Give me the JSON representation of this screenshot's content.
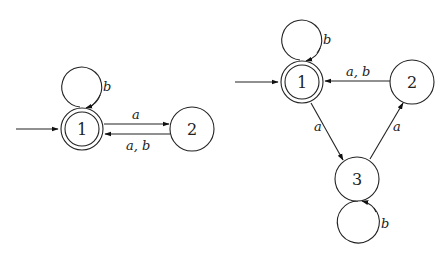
{
  "diagram": {
    "type": "finite-automata",
    "automata": [
      {
        "name": "left",
        "states": [
          {
            "id": "1",
            "label": "1",
            "initial": true,
            "accepting": true
          },
          {
            "id": "2",
            "label": "2",
            "initial": false,
            "accepting": false
          }
        ],
        "transitions": [
          {
            "from": "1",
            "to": "1",
            "label": "b"
          },
          {
            "from": "1",
            "to": "2",
            "label": "a"
          },
          {
            "from": "2",
            "to": "1",
            "label": "a, b"
          }
        ]
      },
      {
        "name": "right",
        "states": [
          {
            "id": "1",
            "label": "1",
            "initial": true,
            "accepting": true
          },
          {
            "id": "2",
            "label": "2",
            "initial": false,
            "accepting": false
          },
          {
            "id": "3",
            "label": "3",
            "initial": false,
            "accepting": false
          }
        ],
        "transitions": [
          {
            "from": "1",
            "to": "1",
            "label": "b"
          },
          {
            "from": "2",
            "to": "1",
            "label": "a, b"
          },
          {
            "from": "1",
            "to": "3",
            "label": "a"
          },
          {
            "from": "3",
            "to": "2",
            "label": "a"
          },
          {
            "from": "3",
            "to": "3",
            "label": "b"
          }
        ]
      }
    ]
  },
  "labels": {
    "left_s1": "1",
    "left_s2": "2",
    "left_loop_b": "b",
    "left_a": "a",
    "left_ab": "a, b",
    "right_s1": "1",
    "right_s2": "2",
    "right_s3": "3",
    "right_loop_b": "b",
    "right_ab": "a, b",
    "right_1to3": "a",
    "right_3to2": "a",
    "right_loop3_b": "b"
  }
}
